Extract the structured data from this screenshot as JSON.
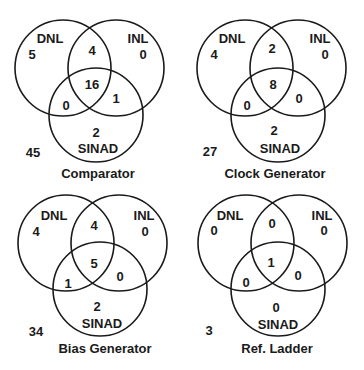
{
  "figure": {
    "set_labels": {
      "dnl": "DNL",
      "inl": "INL",
      "sinad": "SINAD"
    },
    "diagrams": [
      {
        "title": "Comparator",
        "regions": {
          "dnl_only": "5",
          "inl_only": "0",
          "sinad_only": "2",
          "dnl_inl": "4",
          "dnl_sinad": "0",
          "inl_sinad": "1",
          "all_three": "16",
          "outside": "45"
        }
      },
      {
        "title": "Clock Generator",
        "regions": {
          "dnl_only": "4",
          "inl_only": "0",
          "sinad_only": "2",
          "dnl_inl": "2",
          "dnl_sinad": "0",
          "inl_sinad": "0",
          "all_three": "8",
          "outside": "27"
        }
      },
      {
        "title": "Bias Generator",
        "regions": {
          "dnl_only": "4",
          "inl_only": "0",
          "sinad_only": "2",
          "dnl_inl": "4",
          "dnl_sinad": "1",
          "inl_sinad": "0",
          "all_three": "5",
          "outside": "34"
        }
      },
      {
        "title": "Ref. Ladder",
        "regions": {
          "dnl_only": "0",
          "inl_only": "0",
          "sinad_only": "0",
          "dnl_inl": "0",
          "dnl_sinad": "0",
          "inl_sinad": "0",
          "all_three": "1",
          "outside": "3"
        }
      }
    ]
  }
}
